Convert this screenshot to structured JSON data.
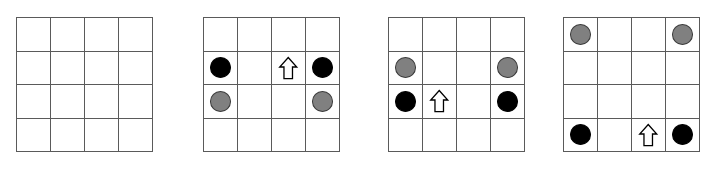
{
  "figure": {
    "title": "",
    "canvas_width": 713,
    "canvas_height": 169,
    "background_color": "#ffffff",
    "panel_count": 4,
    "grid_rows": 4,
    "grid_cols": 4,
    "grid_line_color": "#5a5a5a",
    "colors": {
      "black_disc": "#000000",
      "gray_disc": "#808080",
      "gray_disc_outline": "#3a3a3a",
      "arrow_fill": "#ffffff",
      "arrow_stroke": "#000000"
    },
    "piece_names": {
      "black": "black-disc",
      "gray": "gray-disc",
      "arrow": "up-arrow-icon",
      "empty": "empty-cell"
    },
    "panels": [
      {
        "label": "panel-1",
        "left": 16,
        "top": 17,
        "width": 137,
        "height": 135,
        "cells": [
          [
            "empty",
            "empty",
            "empty",
            "empty"
          ],
          [
            "empty",
            "empty",
            "empty",
            "empty"
          ],
          [
            "empty",
            "empty",
            "empty",
            "empty"
          ],
          [
            "empty",
            "empty",
            "empty",
            "empty"
          ]
        ]
      },
      {
        "label": "panel-2",
        "left": 203,
        "top": 17,
        "width": 137,
        "height": 135,
        "cells": [
          [
            "empty",
            "empty",
            "empty",
            "empty"
          ],
          [
            "black",
            "empty",
            "arrow",
            "black"
          ],
          [
            "gray",
            "empty",
            "empty",
            "gray"
          ],
          [
            "empty",
            "empty",
            "empty",
            "empty"
          ]
        ]
      },
      {
        "label": "panel-3",
        "left": 388,
        "top": 17,
        "width": 137,
        "height": 135,
        "cells": [
          [
            "empty",
            "empty",
            "empty",
            "empty"
          ],
          [
            "gray",
            "empty",
            "empty",
            "gray"
          ],
          [
            "black",
            "arrow",
            "empty",
            "black"
          ],
          [
            "empty",
            "empty",
            "empty",
            "empty"
          ]
        ]
      },
      {
        "label": "panel-4",
        "left": 563,
        "top": 17,
        "width": 137,
        "height": 135,
        "cells": [
          [
            "gray",
            "empty",
            "empty",
            "gray"
          ],
          [
            "empty",
            "empty",
            "empty",
            "empty"
          ],
          [
            "empty",
            "empty",
            "empty",
            "empty"
          ],
          [
            "black",
            "empty",
            "arrow",
            "black"
          ]
        ]
      }
    ]
  }
}
